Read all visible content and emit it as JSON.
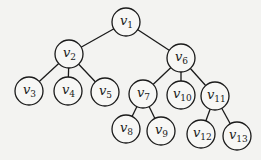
{
  "diagram": {
    "type": "tree",
    "nodes": [
      {
        "id": "v1",
        "base": "v",
        "sub": "1",
        "x": 126,
        "y": 22
      },
      {
        "id": "v2",
        "base": "v",
        "sub": "2",
        "x": 69,
        "y": 54
      },
      {
        "id": "v6",
        "base": "v",
        "sub": "6",
        "x": 181,
        "y": 58
      },
      {
        "id": "v3",
        "base": "v",
        "sub": "3",
        "x": 29,
        "y": 91
      },
      {
        "id": "v4",
        "base": "v",
        "sub": "4",
        "x": 68,
        "y": 91
      },
      {
        "id": "v5",
        "base": "v",
        "sub": "5",
        "x": 105,
        "y": 92
      },
      {
        "id": "v7",
        "base": "v",
        "sub": "7",
        "x": 143,
        "y": 94
      },
      {
        "id": "v10",
        "base": "v",
        "sub": "10",
        "x": 181,
        "y": 95
      },
      {
        "id": "v11",
        "base": "v",
        "sub": "11",
        "x": 215,
        "y": 96
      },
      {
        "id": "v8",
        "base": "v",
        "sub": "8",
        "x": 126,
        "y": 129
      },
      {
        "id": "v9",
        "base": "v",
        "sub": "9",
        "x": 161,
        "y": 131
      },
      {
        "id": "v12",
        "base": "v",
        "sub": "12",
        "x": 201,
        "y": 134
      },
      {
        "id": "v13",
        "base": "v",
        "sub": "13",
        "x": 237,
        "y": 136
      }
    ],
    "edges": [
      [
        "v1",
        "v2"
      ],
      [
        "v1",
        "v6"
      ],
      [
        "v2",
        "v3"
      ],
      [
        "v2",
        "v4"
      ],
      [
        "v2",
        "v5"
      ],
      [
        "v6",
        "v7"
      ],
      [
        "v6",
        "v10"
      ],
      [
        "v6",
        "v11"
      ],
      [
        "v7",
        "v8"
      ],
      [
        "v7",
        "v9"
      ],
      [
        "v11",
        "v12"
      ],
      [
        "v11",
        "v13"
      ]
    ],
    "node_radius": 14
  }
}
